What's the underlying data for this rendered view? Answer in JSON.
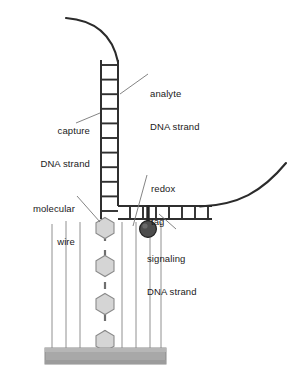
{
  "figure": {
    "type": "schematic-diagram",
    "background_color": "#ffffff"
  },
  "labels": {
    "analyte": {
      "line1": "analyte",
      "line2": "DNA strand",
      "x": 150,
      "y": 68,
      "align": "left"
    },
    "capture": {
      "line1": "capture",
      "line2": "DNA strand",
      "x": 12,
      "y": 105,
      "align": "right",
      "width": 78
    },
    "redox": {
      "line1": "redox",
      "line2": "tag",
      "x": 150,
      "y": 163,
      "align": "left"
    },
    "molecular_wire": {
      "line1": "molecular",
      "line2": "wire",
      "x": 12,
      "y": 183,
      "align": "right",
      "width": 63
    },
    "signaling": {
      "line1": "signaling",
      "line2": "DNA strand",
      "x": 148,
      "y": 233,
      "align": "left"
    }
  },
  "colors": {
    "stroke": "#2b2b2b",
    "strand_stroke": "#333333",
    "leader": "#6e6e6e",
    "hexagon_fill": "#d5d5d5",
    "hexagon_stroke": "#8a8a8a",
    "redox_tag_fill": "#4d4d4d",
    "redox_tag_stroke": "#262626",
    "substrate_fill": "#a8a8a8",
    "substrate_stroke": "#7d7d7d",
    "wire_stroke": "#909090",
    "text": "#1a1a1a"
  },
  "geometry": {
    "vertical_duplex": {
      "left_rail_x": 101,
      "right_rail_x": 118,
      "top_y": 60,
      "bottom_y": 218,
      "rung_count": 11,
      "rung_spacing": 15.5
    },
    "horizontal_duplex": {
      "top_rail_y": 206,
      "bottom_rail_y": 219,
      "left_x": 118,
      "right_x": 212,
      "rung_count": 7,
      "rung_spacing": 14
    },
    "analyte_top_curve": {
      "start_x": 66,
      "start_y": 18,
      "end_x": 118,
      "end_y": 62
    },
    "analyte_right_curve": {
      "start_x": 205,
      "start_y": 207,
      "end_x": 286,
      "end_y": 163
    },
    "redox_tag": {
      "cx": 148,
      "cy": 229,
      "r": 8.5,
      "stem_x": 148,
      "stem_top_y": 206,
      "stem_bottom_y": 222
    },
    "molecular_wire": {
      "x": 105,
      "hexagon_centers_y": [
        228,
        266,
        304,
        341
      ],
      "hexagon_radius": 10.5,
      "dash_segments": 3
    },
    "substrate": {
      "x": 45,
      "y": 348,
      "width": 121,
      "height": 16
    },
    "support_wires_x": [
      52,
      66,
      80,
      105,
      122,
      136,
      150,
      161
    ],
    "support_wires_top_y": 213,
    "support_wires_bottom_y": 349
  }
}
